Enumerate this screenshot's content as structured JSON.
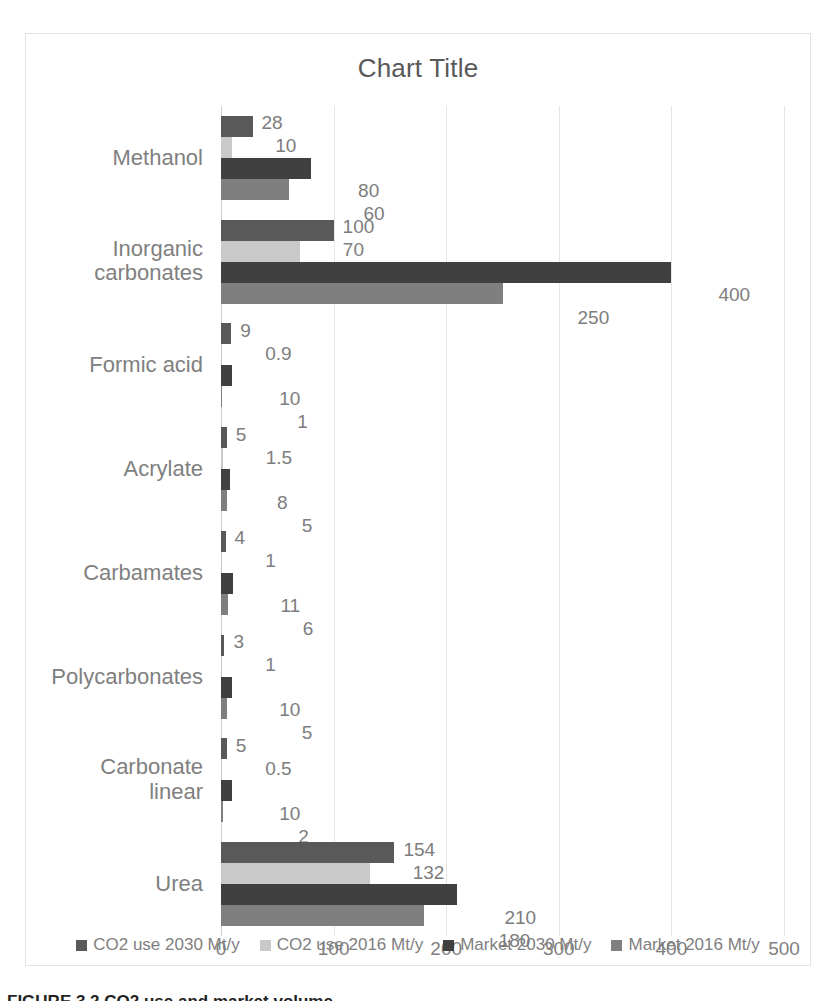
{
  "chart_data": {
    "type": "bar",
    "orientation": "horizontal",
    "title": "Chart Title",
    "xlabel": "",
    "ylabel": "",
    "xlim": [
      0,
      500
    ],
    "xticks": [
      "0",
      "100",
      "200",
      "300",
      "400",
      "500"
    ],
    "grid": true,
    "legend_position": "bottom",
    "categories": [
      "Methanol",
      "Inorganic\ncarbonates",
      "Formic acid",
      "Acrylate",
      "Carbamates",
      "Polycarbonates",
      "Carbonate\nlinear",
      "Urea"
    ],
    "series": [
      {
        "name": "CO2 use 2030 Mt/y",
        "color": "#595959",
        "values": [
          28,
          100,
          9,
          5,
          4,
          3,
          5,
          154
        ],
        "labels": [
          "28",
          "100",
          "9",
          "5",
          "4",
          "3",
          "5",
          "154"
        ]
      },
      {
        "name": "CO2 use 2016 Mt/y",
        "color": "#c9c9c9",
        "values": [
          10,
          70,
          0.9,
          1.5,
          1,
          1,
          0.5,
          132
        ],
        "labels": [
          "10",
          "70",
          "0.9",
          "1.5",
          "1",
          "1",
          "0.5",
          "132"
        ]
      },
      {
        "name": "Market 2030 Mt/y",
        "color": "#404040",
        "values": [
          80,
          400,
          10,
          8,
          11,
          10,
          10,
          210
        ],
        "labels": [
          "80",
          "400",
          "10",
          "8",
          "11",
          "10",
          "10",
          "210"
        ]
      },
      {
        "name": "Market 2016 Mt/y",
        "color": "#7f7f7f",
        "values": [
          60,
          250,
          1,
          5,
          6,
          5,
          2,
          180
        ],
        "labels": [
          "60",
          "250",
          "1",
          "5",
          "6",
          "5",
          "2",
          "180"
        ]
      }
    ]
  },
  "caption": {
    "text": "FIGURE 3.2 CO2 use and market volume."
  }
}
